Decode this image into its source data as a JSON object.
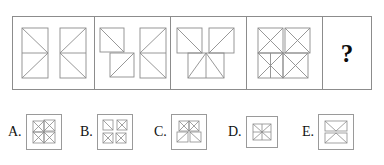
{
  "puzzle": {
    "type": "visual-matrix-reasoning",
    "prompt_symbol": "?",
    "stroke_color": "#8c8c8c",
    "frame_color": "#8c8c8c",
    "option_frame_color": "#9a9a9a",
    "text_color": "#111111",
    "background": "#ffffff"
  },
  "matrix": {
    "cells": [
      {
        "id": "cell-1",
        "name": "matrix-cell-1",
        "width": 82,
        "description": "two tall rectangles, each with mid horizontal line and two diagonals converging to a mid-side vertex; left one points right, right one points left"
      },
      {
        "id": "cell-2",
        "name": "matrix-cell-2",
        "width": 76,
        "description": "left figure two offset squares each with one diagonal meeting corner to corner; right figure tall rectangle with mid line and left-converging diagonals"
      },
      {
        "id": "cell-3",
        "name": "matrix-cell-3",
        "width": 76,
        "description": "two upper squares with diagonals and a lower wide rectangle split by a vertical, all converging at a central point"
      },
      {
        "id": "cell-4",
        "name": "matrix-cell-4",
        "width": 76,
        "description": "full two by two square grid with all diagonals radiating from the centre forming a pinwheel X"
      },
      {
        "id": "cell-5",
        "name": "matrix-cell-answer",
        "width": 48,
        "description": "empty answer cell containing a question mark"
      }
    ]
  },
  "options": [
    {
      "id": "option-a",
      "label": "A.",
      "left": 0,
      "box_size": 36,
      "description": "pinwheel of four quadrants, upper left square set in, diagonals meeting at centre"
    },
    {
      "id": "option-b",
      "label": "B.",
      "left": 72,
      "box_size": 36,
      "description": "four separated quadrant squares each with diagonals, gaps between them"
    },
    {
      "id": "option-c",
      "label": "C.",
      "left": 146,
      "box_size": 36,
      "description": "two upper squares and two lower squares converging at a centre point with fan diagonals"
    },
    {
      "id": "option-d",
      "label": "D.",
      "left": 220,
      "box_size": 32,
      "description": "single compact square with full X diagonals and horizontal plus vertical cross lines"
    },
    {
      "id": "option-e",
      "label": "E.",
      "left": 294,
      "box_size": 36,
      "description": "two stacked wide rectangles, upper with V shape, lower with inverted V shape"
    }
  ]
}
